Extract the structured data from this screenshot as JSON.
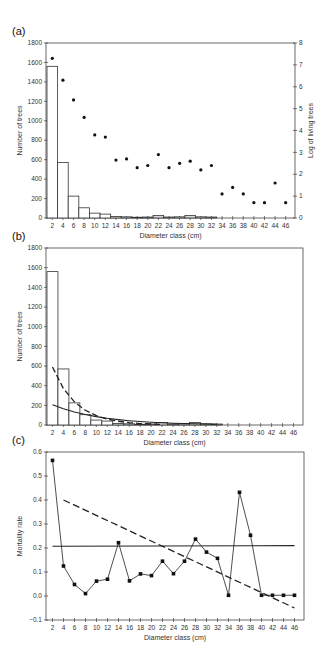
{
  "chart_data": [
    {
      "panel": "(a)",
      "type": "bar",
      "title": "",
      "xlabel": "Diameter class (cm)",
      "ylabel": "Number of trees",
      "y2label": "Log of living trees",
      "categories": [
        "2",
        "4",
        "6",
        "8",
        "10",
        "12",
        "14",
        "16",
        "18",
        "20",
        "22",
        "24",
        "26",
        "28",
        "30",
        "32",
        "34",
        "36",
        "38",
        "40",
        "42",
        "44",
        "46"
      ],
      "ylim": [
        0,
        1800
      ],
      "yticks": [
        0,
        200,
        400,
        600,
        800,
        1000,
        1200,
        1400,
        1600,
        1800
      ],
      "y2lim": [
        0,
        8
      ],
      "y2ticks": [
        0,
        1,
        2,
        3,
        4,
        5,
        6,
        7,
        8
      ],
      "grid": false,
      "series": [
        {
          "name": "Number of trees",
          "type": "bar",
          "values": [
            1560,
            570,
            225,
            105,
            50,
            40,
            15,
            12,
            8,
            10,
            25,
            10,
            12,
            25,
            12,
            10,
            0,
            0,
            0,
            0,
            0,
            0,
            0
          ]
        },
        {
          "name": "Log of living trees",
          "type": "scatter",
          "axis": "right",
          "values": [
            7.3,
            6.3,
            5.4,
            4.6,
            3.8,
            3.7,
            2.65,
            2.7,
            2.3,
            2.4,
            2.9,
            2.3,
            2.5,
            2.6,
            2.2,
            2.4,
            1.1,
            1.4,
            1.1,
            0.7,
            0.7,
            1.6,
            0.7
          ]
        }
      ]
    },
    {
      "panel": "(b)",
      "type": "bar",
      "title": "",
      "xlabel": "Diameter class (cm)",
      "ylabel": "Number of trees",
      "categories": [
        "2",
        "4",
        "6",
        "8",
        "10",
        "12",
        "14",
        "16",
        "18",
        "20",
        "22",
        "24",
        "26",
        "28",
        "30",
        "32",
        "34",
        "36",
        "38",
        "40",
        "42",
        "44",
        "46"
      ],
      "ylim": [
        0,
        1800
      ],
      "yticks": [
        0,
        200,
        400,
        600,
        800,
        1000,
        1200,
        1400,
        1600,
        1800
      ],
      "grid": false,
      "series": [
        {
          "name": "Number of trees",
          "type": "bar",
          "values": [
            1560,
            570,
            225,
            105,
            50,
            40,
            15,
            12,
            8,
            10,
            25,
            10,
            12,
            25,
            12,
            10,
            0,
            0,
            0,
            0,
            0,
            0,
            0
          ]
        },
        {
          "name": "Fit (dashed)",
          "type": "line",
          "style": "dashed",
          "x": [
            2,
            4,
            6,
            8,
            10,
            12,
            14,
            16,
            18,
            20,
            22
          ],
          "values": [
            590,
            370,
            235,
            150,
            95,
            60,
            38,
            24,
            15,
            10,
            6
          ]
        },
        {
          "name": "Fit (solid)",
          "type": "line",
          "style": "solid",
          "x": [
            2,
            4,
            6,
            8,
            10,
            12,
            14,
            16,
            18,
            20,
            22,
            24,
            26,
            28,
            30,
            32
          ],
          "values": [
            205,
            165,
            132,
            106,
            85,
            68,
            55,
            44,
            35,
            28,
            23,
            18,
            15,
            12,
            10,
            8
          ]
        }
      ]
    },
    {
      "panel": "(c)",
      "type": "line",
      "title": "",
      "xlabel": "Diameter class (cm)",
      "ylabel": "Mortality rate",
      "categories": [
        "2",
        "4",
        "6",
        "8",
        "10",
        "12",
        "14",
        "16",
        "18",
        "20",
        "22",
        "24",
        "26",
        "28",
        "30",
        "32",
        "34",
        "36",
        "38",
        "40",
        "42",
        "44",
        "46"
      ],
      "ylim": [
        -0.1,
        0.6
      ],
      "yticks": [
        -0.1,
        0.0,
        0.1,
        0.2,
        0.3,
        0.4,
        0.5,
        0.6
      ],
      "ytick_labels": [
        "−0.1",
        "0.0",
        "0.1",
        "0.2",
        "0.3",
        "0.4",
        "0.5",
        "0.6"
      ],
      "grid": false,
      "series": [
        {
          "name": "Mortality rate",
          "type": "line",
          "marker": "square",
          "values": [
            0.565,
            0.125,
            0.048,
            0.01,
            0.062,
            0.07,
            0.222,
            0.063,
            0.092,
            0.085,
            0.145,
            0.093,
            0.145,
            0.237,
            0.183,
            0.157,
            0.003,
            0.432,
            0.253,
            0.003,
            0.003,
            0.003,
            0.003
          ]
        },
        {
          "name": "Mean",
          "type": "line",
          "style": "solid",
          "x": [
            2,
            46
          ],
          "values": [
            0.207,
            0.21
          ]
        },
        {
          "name": "Trend",
          "type": "line",
          "style": "dashed",
          "x": [
            4,
            46
          ],
          "values": [
            0.4,
            -0.05
          ]
        }
      ]
    }
  ]
}
